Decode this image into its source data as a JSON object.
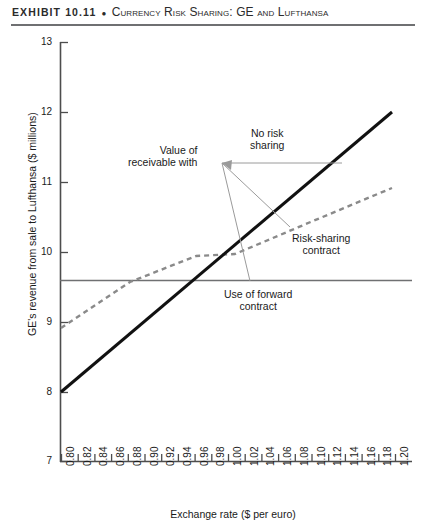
{
  "header": {
    "label": "EXHIBIT 10.11",
    "separator": "●",
    "subject": "Currency Risk Sharing: GE and Lufthansa"
  },
  "axis_titles": {
    "y": "GE's revenue from sale to Lufthansa ($ millions)",
    "x": "Exchange rate ($ per euro)"
  },
  "annotations": {
    "value_receivable_line1": "Value of",
    "value_receivable_line2": "receivable with",
    "no_risk_line1": "No risk",
    "no_risk_line2": "sharing",
    "risk_sharing_line1": "Risk-sharing",
    "risk_sharing_line2": "contract",
    "forward_line1": "Use of forward",
    "forward_line2": "contract"
  },
  "colors": {
    "no_risk_sharing": "#111111",
    "risk_sharing": "#888888",
    "forward_contract": "#6f7072",
    "axis": "#4d4d4d",
    "leader": "#9a9a9a",
    "header_rule": "#6f7072"
  },
  "chart_data": {
    "type": "line",
    "title": "Currency Risk Sharing: GE and Lufthansa",
    "xlabel": "Exchange rate ($ per euro)",
    "ylabel": "GE's revenue from sale to Lufthansa ($ millions)",
    "xlim": [
      0.8,
      1.2
    ],
    "ylim": [
      7,
      13
    ],
    "xticks": [
      "0.80",
      "0.82",
      "0.84",
      "0.86",
      "0.88",
      "0.90",
      "0.92",
      "0.94",
      "0.96",
      "0.98",
      "1.00",
      "1.02",
      "1.04",
      "1.06",
      "1.08",
      "1.10",
      "1.12",
      "1.14",
      "1.16",
      "1.18",
      "1.20"
    ],
    "xtick_values": [
      0.8,
      0.82,
      0.84,
      0.86,
      0.88,
      0.9,
      0.92,
      0.94,
      0.96,
      0.98,
      1.0,
      1.02,
      1.04,
      1.06,
      1.08,
      1.1,
      1.12,
      1.14,
      1.16,
      1.18,
      1.2
    ],
    "yticks": [
      "7",
      "8",
      "9",
      "10",
      "11",
      "12",
      "13"
    ],
    "ytick_values": [
      7,
      8,
      9,
      10,
      11,
      12,
      13
    ],
    "grid": false,
    "legend": "none (direct annotations)",
    "series": [
      {
        "name": "No risk sharing",
        "style": "solid-thick",
        "color": "#111111",
        "x": [
          0.8,
          1.2
        ],
        "values": [
          8.0,
          12.0
        ]
      },
      {
        "name": "Risk-sharing contract",
        "style": "dashed",
        "color": "#888888",
        "x": [
          0.8,
          0.9,
          0.96,
          1.0,
          1.1,
          1.2
        ],
        "values": [
          9.1,
          9.55,
          9.98,
          10.02,
          10.45,
          10.9
        ]
      },
      {
        "name": "Use of forward contract",
        "style": "solid-thin-horizontal",
        "color": "#6f7072",
        "x": [
          0.8,
          1.2
        ],
        "values": [
          9.6,
          9.6
        ]
      }
    ],
    "annotations": [
      {
        "text": "Value of receivable with",
        "x": 0.92,
        "y": 11.2,
        "anchor": "right"
      },
      {
        "text": "No risk sharing",
        "x": 1.03,
        "y": 11.45,
        "anchor": "center"
      },
      {
        "text": "Risk-sharing contract",
        "x": 1.1,
        "y": 10.05,
        "anchor": "center"
      },
      {
        "text": "Use of forward contract",
        "x": 1.03,
        "y": 9.35,
        "anchor": "center"
      }
    ]
  }
}
